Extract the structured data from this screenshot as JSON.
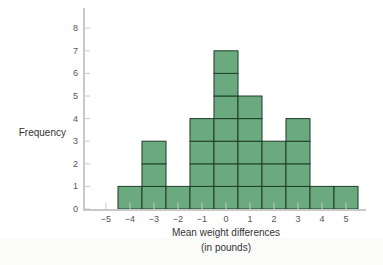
{
  "chart_data": {
    "type": "bar",
    "subtype": "histogram",
    "title": "",
    "xlabel_lines": [
      "Mean weight differences",
      "(in pounds)"
    ],
    "ylabel": "Frequency",
    "x": [
      -4,
      -3,
      -2,
      -1,
      0,
      1,
      2,
      3,
      4,
      5
    ],
    "values": [
      1,
      3,
      1,
      4,
      7,
      5,
      3,
      4,
      1,
      1
    ],
    "xticks": [
      -5,
      -4,
      -3,
      -2,
      -1,
      0,
      1,
      2,
      3,
      4,
      5
    ],
    "yticks": [
      0,
      1,
      2,
      3,
      4,
      5,
      6,
      7,
      8
    ],
    "xlim": [
      -5.5,
      5.6
    ],
    "ylim": [
      0,
      8.5
    ],
    "grid": false,
    "stacked_unit_boxes": true,
    "colors": {
      "bar_fill": "#6aaa7e",
      "bar_stroke": "#1f3d28",
      "axis": "#c8c8c8",
      "text": "#555555"
    }
  }
}
